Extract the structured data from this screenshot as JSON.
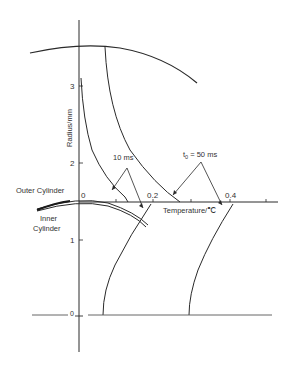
{
  "figure": {
    "y_axis": {
      "label": "Radius/mm",
      "ticks": [
        "3",
        "2",
        "1",
        "0"
      ]
    },
    "x_axis": {
      "label": "Temperature/℃",
      "ticks": [
        "0",
        "0.2",
        "0.4"
      ]
    },
    "annotations": {
      "outer_cylinder": "Outer Cylinder",
      "inner_cylinder_line1": "Inner",
      "inner_cylinder_line2": "Cylinder",
      "curve_10ms": "10 ms",
      "curve_50ms_prefix": "t",
      "curve_50ms_sub": "0",
      "curve_50ms_suffix": " = 50 ms"
    }
  }
}
